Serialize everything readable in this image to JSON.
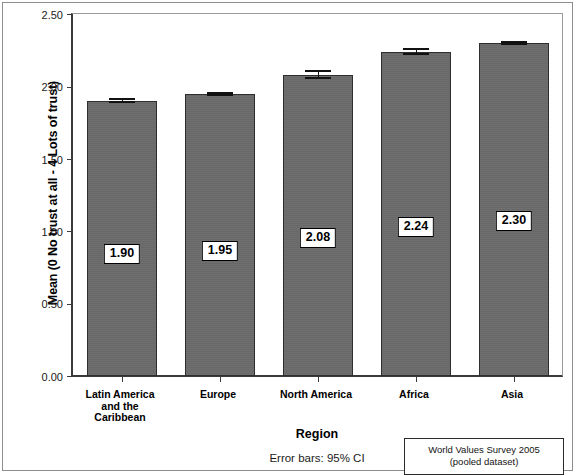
{
  "chart_data": {
    "type": "bar",
    "title": "",
    "xlabel": "Region",
    "ylabel": "Mean (0 No trust at all - 4 Lots of trust)",
    "categories": [
      "Latin America\nand the\nCaribbean",
      "Europe",
      "North America",
      "Africa",
      "Asia"
    ],
    "values": [
      1.9,
      1.95,
      2.08,
      2.24,
      2.3
    ],
    "value_labels": [
      "1.90",
      "1.95",
      "2.08",
      "2.24",
      "2.30"
    ],
    "errors": [
      0.018,
      0.012,
      0.03,
      0.022,
      0.014
    ],
    "ylim": [
      0.0,
      2.5
    ],
    "ytick_values": [
      0.0,
      0.5,
      1.0,
      1.5,
      2.0,
      2.5
    ],
    "ytick_labels": [
      "0.00",
      "0.50",
      "1.00",
      "1.50",
      "2.00",
      "2.50"
    ],
    "grid": false,
    "legend": "none",
    "error_note": "Error bars: 95% CI",
    "annotation": {
      "line1": "World Values Survey 2005",
      "line2": "(pooled dataset)"
    },
    "colors": {
      "bar_fill": "#6a6a6a",
      "bar_edge": "#2e2e2e",
      "axis": "#3a3a3a",
      "label_box_bg": "#ffffff",
      "label_box_border": "#000000",
      "background": "#ffffff"
    }
  }
}
